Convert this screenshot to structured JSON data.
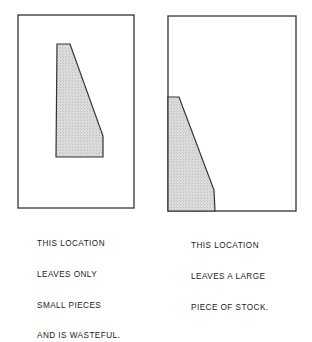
{
  "figure": {
    "stroke_color": "#333333",
    "fill_color": "#d9d9d9",
    "panels": [
      {
        "id": "left",
        "caption_lines": [
          "THIS LOCATION",
          "LEAVES ONLY",
          "SMALL PIECES",
          "AND IS WASTEFUL."
        ]
      },
      {
        "id": "right",
        "caption_lines": [
          "THIS LOCATION",
          "LEAVES A LARGE",
          "PIECE OF STOCK."
        ]
      }
    ]
  }
}
